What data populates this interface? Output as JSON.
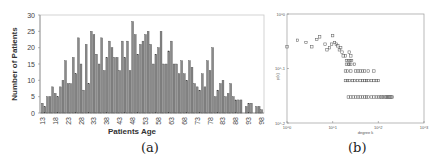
{
  "chart_data": [
    {
      "id": "a",
      "type": "bar",
      "caption": "(a)",
      "title": "",
      "xlabel": "Patients Age",
      "ylabel": "Number of Patients",
      "ylim": [
        0,
        30
      ],
      "yticks": [
        0,
        5,
        10,
        15,
        20,
        25,
        30
      ],
      "xtick_labels": [
        "13",
        "18",
        "23",
        "28",
        "33",
        "38",
        "43",
        "48",
        "53",
        "58",
        "63",
        "68",
        "73",
        "78",
        "83",
        "88",
        "93",
        "98"
      ],
      "grid": false,
      "bar_color": "#8a8a8a",
      "bar_edge": "#444444",
      "categories": [
        13,
        14,
        15,
        16,
        17,
        18,
        19,
        20,
        21,
        22,
        23,
        24,
        25,
        26,
        27,
        28,
        29,
        30,
        31,
        32,
        33,
        34,
        35,
        36,
        37,
        38,
        39,
        40,
        41,
        42,
        43,
        44,
        45,
        46,
        47,
        48,
        49,
        50,
        51,
        52,
        53,
        54,
        55,
        56,
        57,
        58,
        59,
        60,
        61,
        62,
        63,
        64,
        65,
        66,
        67,
        68,
        69,
        70,
        71,
        72,
        73,
        74,
        75,
        76,
        77,
        78,
        79,
        80,
        81,
        82,
        83,
        84,
        85,
        86,
        87,
        88,
        89,
        90,
        91,
        92,
        93,
        94,
        95,
        96,
        97,
        98
      ],
      "values": [
        3,
        2,
        5,
        5,
        8,
        6,
        5,
        8,
        10,
        16,
        9,
        9,
        17,
        12,
        23,
        15,
        7,
        21,
        9,
        25,
        24,
        18,
        15,
        23,
        13,
        17,
        22,
        20,
        17,
        17,
        13,
        22,
        17,
        22,
        13,
        28,
        24,
        18,
        21,
        22,
        24,
        25,
        21,
        15,
        18,
        20,
        25,
        15,
        15,
        19,
        22,
        15,
        15,
        12,
        16,
        12,
        10,
        16,
        14,
        9,
        8,
        7,
        12,
        8,
        16,
        13,
        20,
        5,
        7,
        9,
        10,
        5,
        6,
        9,
        5,
        4,
        4,
        4,
        0,
        2,
        3,
        3,
        0,
        2,
        2,
        1
      ]
    },
    {
      "id": "b",
      "type": "scatter",
      "caption": "(b)",
      "title": "",
      "xlabel": "degree k",
      "ylabel": "p(k)",
      "xscale": "log",
      "yscale": "log",
      "xlim": [
        1,
        1000
      ],
      "ylim": [
        0.01,
        1
      ],
      "xtick_labels": [
        "10^0",
        "10^1",
        "10^2",
        "10^3"
      ],
      "ytick_labels": [
        "10^-2",
        "10^-1",
        "10^0"
      ],
      "marker": "open-square",
      "points": [
        [
          1.0,
          0.25
        ],
        [
          1.7,
          0.33
        ],
        [
          2.6,
          0.3
        ],
        [
          3.5,
          0.25
        ],
        [
          4.5,
          0.34
        ],
        [
          5.2,
          0.38
        ],
        [
          6.8,
          0.28
        ],
        [
          7.5,
          0.22
        ],
        [
          8.5,
          0.24
        ],
        [
          9.5,
          0.28
        ],
        [
          10,
          0.4
        ],
        [
          11,
          0.3
        ],
        [
          12,
          0.28
        ],
        [
          13,
          0.26
        ],
        [
          14,
          0.22
        ],
        [
          15,
          0.24
        ],
        [
          16,
          0.2
        ],
        [
          17,
          0.17
        ],
        [
          19,
          0.17
        ],
        [
          23,
          0.2
        ],
        [
          25,
          0.17
        ],
        [
          20,
          0.14
        ],
        [
          22,
          0.14
        ],
        [
          24,
          0.14
        ],
        [
          26,
          0.14
        ],
        [
          20,
          0.12
        ],
        [
          22,
          0.12
        ],
        [
          23,
          0.12
        ],
        [
          25,
          0.12
        ],
        [
          30,
          0.12
        ],
        [
          19,
          0.09
        ],
        [
          21,
          0.09
        ],
        [
          25,
          0.09
        ],
        [
          32,
          0.09
        ],
        [
          36,
          0.09
        ],
        [
          40,
          0.09
        ],
        [
          45,
          0.09
        ],
        [
          50,
          0.09
        ],
        [
          60,
          0.09
        ],
        [
          80,
          0.09
        ],
        [
          19,
          0.06
        ],
        [
          21,
          0.06
        ],
        [
          23,
          0.06
        ],
        [
          27,
          0.06
        ],
        [
          30,
          0.06
        ],
        [
          35,
          0.06
        ],
        [
          40,
          0.06
        ],
        [
          45,
          0.06
        ],
        [
          50,
          0.06
        ],
        [
          55,
          0.06
        ],
        [
          60,
          0.06
        ],
        [
          70,
          0.06
        ],
        [
          80,
          0.06
        ],
        [
          90,
          0.06
        ],
        [
          100,
          0.06
        ],
        [
          22,
          0.03
        ],
        [
          25,
          0.03
        ],
        [
          28,
          0.03
        ],
        [
          32,
          0.03
        ],
        [
          36,
          0.03
        ],
        [
          40,
          0.03
        ],
        [
          45,
          0.03
        ],
        [
          50,
          0.03
        ],
        [
          55,
          0.03
        ],
        [
          60,
          0.03
        ],
        [
          70,
          0.03
        ],
        [
          80,
          0.03
        ],
        [
          90,
          0.03
        ],
        [
          100,
          0.03
        ],
        [
          110,
          0.03
        ],
        [
          120,
          0.03
        ],
        [
          130,
          0.03
        ],
        [
          140,
          0.03
        ],
        [
          150,
          0.03
        ],
        [
          160,
          0.03
        ],
        [
          170,
          0.03
        ],
        [
          180,
          0.03
        ],
        [
          190,
          0.03
        ],
        [
          200,
          0.03
        ]
      ]
    }
  ]
}
